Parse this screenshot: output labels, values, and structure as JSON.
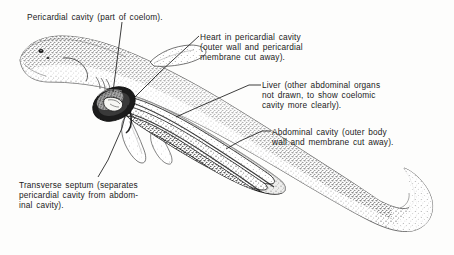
{
  "figure": {
    "background_color": "#fdfdfc",
    "ink_color": "#1b1b1b",
    "width": 454,
    "height": 255
  },
  "labels": [
    {
      "id": "pericardial-cavity",
      "text": "Pericardial cavity (part of coelom).",
      "x": 27,
      "y": 12
    },
    {
      "id": "heart",
      "text": "Heart  in  pericardial   cavity\n(outer   wall   and   pericardial\nmembrane cut away).",
      "x": 200,
      "y": 32
    },
    {
      "id": "liver",
      "text": "Liver (other abdominal organs\nnot drawn, to show coelomic\ncavity  more  clearly).",
      "x": 262,
      "y": 80
    },
    {
      "id": "abdominal-cavity",
      "text": "Abdominal cavity  (outer body\nwall and membrane cut away).",
      "x": 272,
      "y": 127
    },
    {
      "id": "transverse-septum",
      "text": "Transverse  septum  (separates\npericardial cavity from abdom-\ninal cavity).",
      "x": 19,
      "y": 180
    }
  ],
  "leader_lines": [
    {
      "id": "leader-pericardial-cavity",
      "from_label": "pericardial-cavity",
      "points": "122,22 121,30 113,92"
    },
    {
      "id": "leader-heart",
      "from_label": "heart",
      "points": "199,36 186,48 160,72 131,101"
    },
    {
      "id": "leader-liver",
      "from_label": "liver",
      "points": "261,85 249,85 196,108 176,117"
    },
    {
      "id": "leader-abdominal-cavity",
      "from_label": "abdominal-cavity",
      "points": "271,131 262,131 240,141 226,149"
    },
    {
      "id": "leader-transverse-septum",
      "from_label": "transverse-septum",
      "points": "98,177 108,160 122,128 128,105"
    }
  ],
  "anatomy": {
    "parts": [
      {
        "id": "body",
        "name": "shark body outline"
      },
      {
        "id": "head",
        "name": "head and snout"
      },
      {
        "id": "eye",
        "name": "eye"
      },
      {
        "id": "spiracle",
        "name": "spiracle"
      },
      {
        "id": "gill-slits",
        "name": "gill slits"
      },
      {
        "id": "pectoral-fin",
        "name": "pectoral fin"
      },
      {
        "id": "pelvic-fin",
        "name": "pelvic fin"
      },
      {
        "id": "dorsal-fin",
        "name": "first dorsal fin"
      },
      {
        "id": "caudal-fin",
        "name": "heterocercal caudal fin"
      },
      {
        "id": "pericardial-opening",
        "name": "pericardial cavity opening"
      },
      {
        "id": "heart-shape",
        "name": "heart"
      },
      {
        "id": "abdominal-opening",
        "name": "abdominal cavity opening"
      },
      {
        "id": "liver-lobes",
        "name": "liver lobes"
      },
      {
        "id": "transverse-septum-wall",
        "name": "transverse septum"
      }
    ]
  }
}
